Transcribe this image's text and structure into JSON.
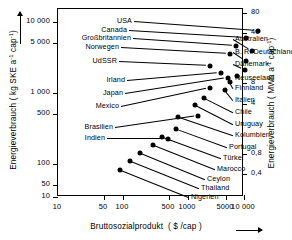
{
  "chart_data": {
    "type": "scatter",
    "title": "",
    "xlabel": "Bruttosozialprodukt ( $ /cap )",
    "ylabel_left": "Energieverbrauch ( kg SKE a⁻¹ cap⁻¹)",
    "ylabel_right": "Energieverbrauch ( MWh a⁻¹ cap⁻¹)",
    "xscale": "log",
    "yscale": "log",
    "xlim": [
      10,
      10000
    ],
    "ylim_left": [
      10,
      12000
    ],
    "grid": false,
    "legend": "none",
    "xticks": [
      "10",
      "50",
      "100",
      "500",
      "1000",
      "5000",
      "10 000"
    ],
    "xtickvalues": [
      10,
      50,
      100,
      500,
      1000,
      5000,
      10000
    ],
    "yticks_left": [
      "10 000",
      "5 000",
      "1 000",
      "500",
      "100",
      "50",
      "10"
    ],
    "ytickvalues_left": [
      10000,
      5000,
      1000,
      500,
      100,
      50,
      10
    ],
    "yticks_right": [
      "80",
      "40",
      "8",
      "4",
      "0,8",
      "0,4"
    ],
    "ytickvalues_right": [
      80,
      40,
      8,
      4,
      0.8,
      0.4
    ],
    "points": [
      {
        "label": "USA",
        "side": "left",
        "gnp": 4200,
        "energy": 11000
      },
      {
        "label": "Canada",
        "side": "left",
        "gnp": 3200,
        "energy": 8500
      },
      {
        "label": "Großbritannien",
        "side": "left",
        "gnp": 2100,
        "energy": 5400
      },
      {
        "label": "Norwegen",
        "side": "left",
        "gnp": 2500,
        "energy": 4400
      },
      {
        "label": "UdSSR",
        "side": "left",
        "gnp": 1400,
        "energy": 4000
      },
      {
        "label": "Irland",
        "side": "left",
        "gnp": 1200,
        "energy": 2600
      },
      {
        "label": "Japan",
        "side": "left",
        "gnp": 1700,
        "energy": 2400
      },
      {
        "label": "Mexico",
        "side": "left",
        "gnp": 640,
        "energy": 1150
      },
      {
        "label": "Brasilien",
        "side": "left",
        "gnp": 390,
        "energy": 450
      },
      {
        "label": "Indien",
        "side": "left",
        "gnp": 100,
        "energy": 190
      },
      {
        "label": "Australien",
        "side": "right",
        "gnp": 2700,
        "energy": 6000
      },
      {
        "label": "B. R. Deutschland",
        "side": "right",
        "gnp": 2800,
        "energy": 4600
      },
      {
        "label": "Dänemark",
        "side": "right",
        "gnp": 3000,
        "energy": 3900
      },
      {
        "label": "Neuseeland",
        "side": "right",
        "gnp": 2300,
        "energy": 2600
      },
      {
        "label": "Finnland",
        "side": "right",
        "gnp": 2000,
        "energy": 2300
      },
      {
        "label": "Italien",
        "side": "right",
        "gnp": 1600,
        "energy": 1800
      },
      {
        "label": "Chile",
        "side": "right",
        "gnp": 700,
        "energy": 1100
      },
      {
        "label": "Uruguay",
        "side": "right",
        "gnp": 600,
        "energy": 800
      },
      {
        "label": "Kolumbien",
        "side": "right",
        "gnp": 330,
        "energy": 480
      },
      {
        "label": "Portugal",
        "side": "right",
        "gnp": 520,
        "energy": 420
      },
      {
        "label": "Türkei",
        "side": "right",
        "gnp": 300,
        "energy": 290
      },
      {
        "label": "Marocco",
        "side": "right",
        "gnp": 180,
        "energy": 175
      },
      {
        "label": "Ceylon",
        "side": "right",
        "gnp": 160,
        "energy": 110
      },
      {
        "label": "Thailand",
        "side": "right",
        "gnp": 150,
        "energy": 80
      },
      {
        "label": "Nigerien",
        "side": "right",
        "gnp": 105,
        "energy": 50
      }
    ]
  },
  "layout": {
    "plot": {
      "x": 57,
      "y": 8,
      "w": 186,
      "h": 188
    },
    "x_px": {
      "10": 0,
      "50": 46,
      "100": 65,
      "500": 111,
      "1000": 130,
      "5000": 168,
      "10000": 186
    },
    "y_px": {
      "10000": 13,
      "5000": 34,
      "1000": 84,
      "500": 105,
      "100": 155,
      "50": 176,
      "10": 188
    },
    "yr_px": {
      "80": 4,
      "40": 24,
      "8": 74,
      "4": 95,
      "0,8": 145,
      "0,4": 165
    },
    "labels": [
      {
        "lx": 75,
        "ly": 13,
        "px": 200,
        "py": 22,
        "anchor": "l"
      },
      {
        "lx": 70,
        "ly": 22,
        "px": 188,
        "py": 29,
        "anchor": "l"
      },
      {
        "lx": 74,
        "ly": 30,
        "px": 178,
        "py": 37,
        "anchor": "l"
      },
      {
        "lx": 62,
        "ly": 39,
        "px": 172,
        "py": 45,
        "anchor": "l"
      },
      {
        "lx": 60,
        "ly": 53,
        "px": 152,
        "py": 57,
        "anchor": "l"
      },
      {
        "lx": 68,
        "ly": 72,
        "px": 163,
        "py": 64,
        "anchor": "l"
      },
      {
        "lx": 66,
        "ly": 85,
        "px": 170,
        "py": 69,
        "anchor": "l"
      },
      {
        "lx": 62,
        "ly": 98,
        "px": 152,
        "py": 79,
        "anchor": "l"
      },
      {
        "lx": 56,
        "ly": 119,
        "px": 140,
        "py": 107,
        "anchor": "l"
      },
      {
        "lx": 48,
        "ly": 130,
        "px": 110,
        "py": 130,
        "anchor": "l"
      },
      {
        "lx": 178,
        "ly": 31,
        "px": 194,
        "py": 42,
        "anchor": "r"
      },
      {
        "lx": 178,
        "ly": 44,
        "px": 188,
        "py": 52,
        "anchor": "r"
      },
      {
        "lx": 178,
        "ly": 56,
        "px": 187,
        "py": 61,
        "anchor": "r"
      },
      {
        "lx": 178,
        "ly": 70,
        "px": 179,
        "py": 67,
        "anchor": "r"
      },
      {
        "lx": 178,
        "ly": 80,
        "px": 172,
        "py": 73,
        "anchor": "r"
      },
      {
        "lx": 178,
        "ly": 92,
        "px": 167,
        "py": 81,
        "anchor": "r"
      },
      {
        "lx": 178,
        "ly": 104,
        "px": 146,
        "py": 89,
        "anchor": "r"
      },
      {
        "lx": 178,
        "ly": 116,
        "px": 137,
        "py": 96,
        "anchor": "r"
      },
      {
        "lx": 178,
        "ly": 127,
        "px": 120,
        "py": 108,
        "anchor": "r"
      },
      {
        "lx": 172,
        "ly": 139,
        "px": 118,
        "py": 120,
        "anchor": "r"
      },
      {
        "lx": 166,
        "ly": 150,
        "px": 104,
        "py": 128,
        "anchor": "r"
      },
      {
        "lx": 160,
        "ly": 161,
        "px": 95,
        "py": 136,
        "anchor": "r"
      },
      {
        "lx": 150,
        "ly": 171,
        "px": 82,
        "py": 144,
        "anchor": "r"
      },
      {
        "lx": 144,
        "ly": 180,
        "px": 72,
        "py": 152,
        "anchor": "r"
      },
      {
        "lx": 134,
        "ly": 189,
        "px": 62,
        "py": 161,
        "anchor": "r"
      }
    ]
  }
}
